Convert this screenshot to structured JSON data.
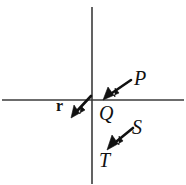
{
  "figure": {
    "background_color": "#ffffff",
    "width": 186,
    "height": 185
  },
  "axes": {
    "color": "#3b3b3b",
    "stroke_width": 1.6,
    "origin": {
      "x": 92,
      "y": 100
    },
    "horizontal": {
      "name": "x-axis",
      "x1": 2,
      "y1": 100,
      "x2": 184,
      "y2": 100
    },
    "vertical": {
      "name": "y-axis",
      "x1": 92,
      "y1": 7,
      "x2": 92,
      "y2": 184
    }
  },
  "vectors": [
    {
      "id": "r",
      "label": "r",
      "label_style": "bold",
      "description": "position vector pointing down-left from origin",
      "color": "#111111",
      "tail": {
        "x": 91,
        "y": 96
      },
      "tip": {
        "x": 72,
        "y": 117
      },
      "label_pos": {
        "x": 56,
        "y": 98
      }
    },
    {
      "id": "P",
      "label": "P",
      "label_style": "italic",
      "description": "arrow pointing down-left toward origin from upper right",
      "color": "#111111",
      "tail": {
        "x": 131,
        "y": 80
      },
      "tip": {
        "x": 104,
        "y": 99
      },
      "label_pos": {
        "x": 134,
        "y": 68
      }
    },
    {
      "id": "Q",
      "label": "Q",
      "label_style": "italic",
      "description": "point label just below-right of origin",
      "color": "#111111",
      "label_pos": {
        "x": 99,
        "y": 103
      }
    },
    {
      "id": "S",
      "label": "S",
      "label_style": "italic",
      "description": "arrow pointing down-left, label above right of arrow",
      "color": "#111111",
      "tail": {
        "x": 133,
        "y": 128
      },
      "tip": {
        "x": 108,
        "y": 149
      },
      "label_pos": {
        "x": 132,
        "y": 117
      }
    },
    {
      "id": "T",
      "label": "T",
      "label_style": "italic",
      "description": "label below-left at arrow tip of S",
      "color": "#111111",
      "label_pos": {
        "x": 99,
        "y": 150
      }
    }
  ],
  "colors": {
    "ink": "#111111",
    "axis": "#3b3b3b",
    "paper": "#ffffff"
  }
}
